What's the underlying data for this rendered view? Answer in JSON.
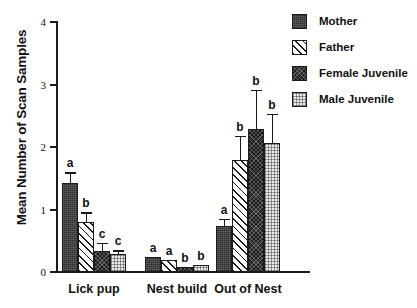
{
  "chart_data": {
    "type": "bar",
    "title": "",
    "xlabel": "",
    "ylabel": "Mean Number of Scan Samples",
    "ylim": [
      0,
      4
    ],
    "yticks": [
      0,
      1,
      2,
      3,
      4
    ],
    "ytick_labels": [
      "0",
      "1",
      "2",
      "3",
      "4"
    ],
    "grid": false,
    "legend_position": "right",
    "categories": [
      "Lick pup",
      "Nest build",
      "Out of Nest"
    ],
    "series": [
      {
        "name": "Mother",
        "pattern": "dark-solid",
        "color": "#4a4a4a",
        "values": [
          1.42,
          0.24,
          0.73
        ],
        "errors_upper": [
          0.18,
          0.0,
          0.12
        ],
        "sig_letters": [
          "a",
          "a",
          "a"
        ]
      },
      {
        "name": "Father",
        "pattern": "diagonal-hatch",
        "color": "#ffffff",
        "values": [
          0.8,
          0.19,
          1.79
        ],
        "errors_upper": [
          0.16,
          0.0,
          0.39
        ],
        "sig_letters": [
          "b",
          "a",
          "b"
        ]
      },
      {
        "name": "Female Juvenile",
        "pattern": "dark-checker",
        "color": "#1c1c1c",
        "values": [
          0.34,
          0.08,
          2.29
        ],
        "errors_upper": [
          0.13,
          0.0,
          0.63
        ],
        "sig_letters": [
          "c",
          "b",
          "b"
        ]
      },
      {
        "name": "Male Juvenile",
        "pattern": "light-dot",
        "color": "#ececec",
        "values": [
          0.29,
          0.11,
          2.07
        ],
        "errors_upper": [
          0.06,
          0.0,
          0.46
        ],
        "sig_letters": [
          "c",
          "b",
          "b"
        ]
      }
    ]
  },
  "legend": {
    "items": [
      {
        "label": "Mother"
      },
      {
        "label": "Father"
      },
      {
        "label": "Female Juvenile"
      },
      {
        "label": "Male Juvenile"
      }
    ]
  },
  "axis": {
    "y_title": "Mean Number of Scan Samples",
    "y_tick_labels": [
      "4",
      "3",
      "2",
      "1",
      "0"
    ]
  },
  "group_labels": [
    "Lick pup",
    "Nest build",
    "Out of Nest"
  ]
}
